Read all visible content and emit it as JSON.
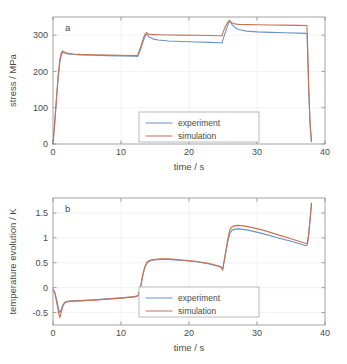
{
  "figure": {
    "panels": [
      {
        "id": "a",
        "panel_label": "a",
        "legend": {
          "entries": [
            "experiment",
            "simulation"
          ]
        }
      },
      {
        "id": "b",
        "panel_label": "b",
        "legend": {
          "entries": [
            "experiment",
            "simulation"
          ]
        }
      }
    ],
    "colors": {
      "experiment": "#6a93c0",
      "simulation": "#c8714f",
      "axis": "#8c8c8c",
      "grid": "#ececed",
      "text": "#4a4a4a"
    }
  },
  "chart_data": [
    {
      "type": "line",
      "panel": "a",
      "title": "",
      "xlabel": "time / s",
      "ylabel": "stress / MPa",
      "xlim": [
        0,
        40
      ],
      "ylim": [
        0,
        350
      ],
      "xticks": [
        0,
        10,
        20,
        30,
        40
      ],
      "yticks": [
        0,
        100,
        200,
        300
      ],
      "xticklabels": [
        "0",
        "10",
        "20",
        "30",
        "40"
      ],
      "yticklabels": [
        "0",
        "100",
        "200",
        "300"
      ],
      "grid": true,
      "legend_position": "center",
      "annotation": "a",
      "series": [
        {
          "name": "experiment",
          "color": "#6a93c0",
          "x": [
            0.0,
            0.25,
            0.5,
            0.75,
            1.0,
            1.2,
            1.35,
            1.5,
            1.8,
            2.2,
            3.0,
            4.0,
            6.0,
            8.0,
            10.0,
            12.0,
            12.45,
            12.5,
            12.9,
            13.3,
            13.6,
            13.75,
            13.9,
            14.2,
            14.8,
            15.5,
            17.0,
            19.0,
            21.0,
            23.0,
            24.6,
            24.85,
            24.9,
            25.3,
            25.7,
            25.95,
            26.1,
            26.3,
            26.7,
            27.4,
            28.5,
            30.0,
            32.0,
            34.0,
            36.0,
            37.2,
            37.35,
            37.45,
            37.6,
            37.8,
            38.0
          ],
          "y": [
            0,
            55,
            120,
            180,
            225,
            243,
            250,
            252,
            250,
            248,
            246.5,
            245.5,
            244.5,
            243.5,
            243,
            242,
            241.5,
            243,
            262,
            285,
            299,
            303,
            300,
            294,
            289,
            286.5,
            284,
            282.5,
            281,
            280,
            279,
            278.5,
            282,
            305,
            327,
            338,
            336,
            330,
            322,
            315,
            311,
            309,
            307.5,
            306.5,
            305.5,
            305,
            304.5,
            250,
            150,
            55,
            6
          ]
        },
        {
          "name": "simulation",
          "color": "#c8714f",
          "x": [
            0.0,
            0.25,
            0.5,
            0.75,
            1.0,
            1.2,
            1.35,
            1.5,
            1.8,
            2.2,
            3.0,
            4.0,
            6.0,
            8.0,
            10.0,
            12.0,
            12.45,
            12.5,
            12.9,
            13.3,
            13.6,
            13.75,
            13.9,
            14.2,
            14.8,
            15.5,
            17.0,
            19.0,
            21.0,
            23.0,
            24.6,
            24.85,
            24.9,
            25.3,
            25.7,
            25.95,
            26.1,
            26.3,
            26.7,
            27.4,
            28.5,
            30.0,
            32.0,
            34.0,
            36.0,
            37.2,
            37.35,
            37.45,
            37.6,
            37.8,
            38.0
          ],
          "y": [
            0,
            58,
            125,
            187,
            232,
            250,
            256,
            255,
            252,
            250,
            248,
            247,
            246,
            245,
            244.5,
            244,
            243.5,
            246,
            268,
            292,
            305,
            307,
            304,
            302,
            301.5,
            301,
            300.5,
            300,
            299.5,
            299,
            298.5,
            298,
            302,
            322,
            336,
            341,
            338,
            334,
            331,
            329.5,
            329,
            328.5,
            328,
            327.5,
            327,
            326.5,
            326,
            265,
            160,
            60,
            8
          ]
        }
      ]
    },
    {
      "type": "line",
      "panel": "b",
      "title": "",
      "xlabel": "time / s",
      "ylabel": "temperature evolution / K",
      "xlim": [
        0,
        40
      ],
      "ylim": [
        -0.75,
        1.8
      ],
      "xticks": [
        0,
        10,
        20,
        30,
        40
      ],
      "yticks": [
        -0.5,
        0,
        0.5,
        1,
        1.5
      ],
      "xticklabels": [
        "0",
        "10",
        "20",
        "30",
        "40"
      ],
      "yticklabels": [
        "-0.5",
        "0",
        "0.5",
        "1",
        "1.5"
      ],
      "grid": true,
      "legend_position": "center",
      "annotation": "b",
      "series": [
        {
          "name": "experiment",
          "color": "#6a93c0",
          "x": [
            0.0,
            0.3,
            0.6,
            0.85,
            1.0,
            1.15,
            1.4,
            1.7,
            2.0,
            2.4,
            3.0,
            4.0,
            6.0,
            8.0,
            10.0,
            12.0,
            12.4,
            12.55,
            12.9,
            13.2,
            13.5,
            13.8,
            14.1,
            14.5,
            15.0,
            15.8,
            16.5,
            17.5,
            19.0,
            21.0,
            23.0,
            24.5,
            24.8,
            24.95,
            25.3,
            25.7,
            26.0,
            26.3,
            26.8,
            27.3,
            27.9,
            28.5,
            29.5,
            31.0,
            33.0,
            35.0,
            36.5,
            37.2,
            37.4,
            37.6,
            37.9,
            38.0
          ],
          "y": [
            -0.03,
            -0.1,
            -0.28,
            -0.44,
            -0.5,
            -0.46,
            -0.36,
            -0.3,
            -0.28,
            -0.27,
            -0.265,
            -0.26,
            -0.245,
            -0.225,
            -0.205,
            -0.18,
            -0.165,
            -0.15,
            0.02,
            0.24,
            0.4,
            0.49,
            0.525,
            0.545,
            0.555,
            0.565,
            0.565,
            0.56,
            0.545,
            0.52,
            0.475,
            0.42,
            0.4,
            0.35,
            0.62,
            0.92,
            1.09,
            1.15,
            1.175,
            1.18,
            1.17,
            1.16,
            1.13,
            1.08,
            1.0,
            0.93,
            0.87,
            0.84,
            0.86,
            1.05,
            1.5,
            1.68
          ]
        },
        {
          "name": "simulation",
          "color": "#c8714f",
          "x": [
            0.0,
            0.3,
            0.6,
            0.85,
            1.0,
            1.15,
            1.4,
            1.7,
            2.0,
            2.4,
            3.0,
            4.0,
            6.0,
            8.0,
            10.0,
            12.0,
            12.4,
            12.55,
            12.9,
            13.2,
            13.5,
            13.8,
            14.1,
            14.5,
            15.0,
            15.8,
            16.5,
            17.5,
            19.0,
            21.0,
            23.0,
            24.5,
            24.8,
            24.95,
            25.3,
            25.7,
            26.0,
            26.3,
            26.8,
            27.3,
            27.9,
            28.5,
            29.5,
            31.0,
            33.0,
            35.0,
            36.5,
            37.2,
            37.4,
            37.6,
            37.9,
            38.0
          ],
          "y": [
            -0.04,
            -0.13,
            -0.34,
            -0.52,
            -0.6,
            -0.53,
            -0.39,
            -0.31,
            -0.285,
            -0.275,
            -0.27,
            -0.265,
            -0.25,
            -0.23,
            -0.21,
            -0.185,
            -0.17,
            -0.155,
            0.03,
            0.26,
            0.42,
            0.505,
            0.54,
            0.56,
            0.57,
            0.578,
            0.578,
            0.572,
            0.556,
            0.53,
            0.485,
            0.43,
            0.41,
            0.36,
            0.65,
            0.97,
            1.16,
            1.22,
            1.245,
            1.25,
            1.24,
            1.23,
            1.2,
            1.15,
            1.065,
            0.98,
            0.915,
            0.885,
            0.9,
            1.08,
            1.52,
            1.7
          ]
        }
      ]
    }
  ]
}
